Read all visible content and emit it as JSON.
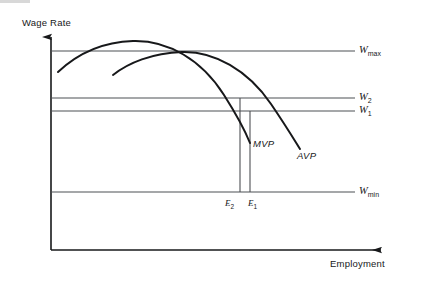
{
  "figure": {
    "type": "economics-diagram",
    "title": "",
    "axes": {
      "y_label": "Wage Rate",
      "x_label": "Employment",
      "origin": [
        51,
        250
      ],
      "y_axis_top": [
        51,
        32
      ],
      "x_axis_right": [
        390,
        250
      ]
    },
    "wage_lines": [
      {
        "id": "wmax",
        "label": "W",
        "subscript": "max",
        "y": 51
      },
      {
        "id": "w2",
        "label": "W",
        "subscript": "2",
        "y": 98
      },
      {
        "id": "w1",
        "label": "W",
        "subscript": "1",
        "y": 111
      },
      {
        "id": "wmin",
        "label": "W",
        "subscript": "min",
        "y": 192
      }
    ],
    "employment_lines": [
      {
        "id": "e2",
        "label": "E",
        "subscript": "2",
        "x": 240,
        "top": 98,
        "bottom": 192
      },
      {
        "id": "e1",
        "label": "E",
        "subscript": "1",
        "x": 250,
        "top": 111,
        "bottom": 192
      }
    ],
    "curves": [
      {
        "id": "mvp",
        "label": "MVP",
        "label_pos": [
          253,
          146
        ],
        "path": "M 58,72 C 75,56 100,42 133,41 C 168,40 202,60 224,95 C 238,117 246,133 250,143"
      },
      {
        "id": "avp",
        "label": "AVP",
        "label_pos": [
          300,
          157
        ],
        "path": "M 113,75 C 128,63 152,53 182,52 C 214,51 248,70 271,104 C 286,126 295,141 300,149"
      }
    ]
  },
  "colors": {
    "ink": "#17181a",
    "reference_line": "#4d5054",
    "background": "#ffffff"
  }
}
